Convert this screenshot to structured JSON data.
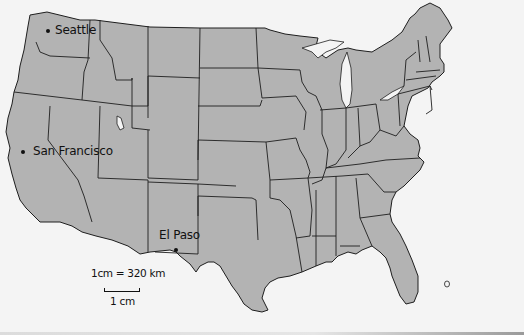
{
  "map": {
    "title": "Contiguous United States",
    "cities": [
      {
        "name": "Seattle"
      },
      {
        "name": "San Francisco"
      },
      {
        "name": "El Paso"
      }
    ],
    "scale": {
      "ratio_label": "1cm = 320 km",
      "bar_label": "1 cm"
    },
    "colors": {
      "land": "#b3b3b3",
      "background": "#f4f4f4",
      "borders": "#1e1e1e"
    }
  }
}
